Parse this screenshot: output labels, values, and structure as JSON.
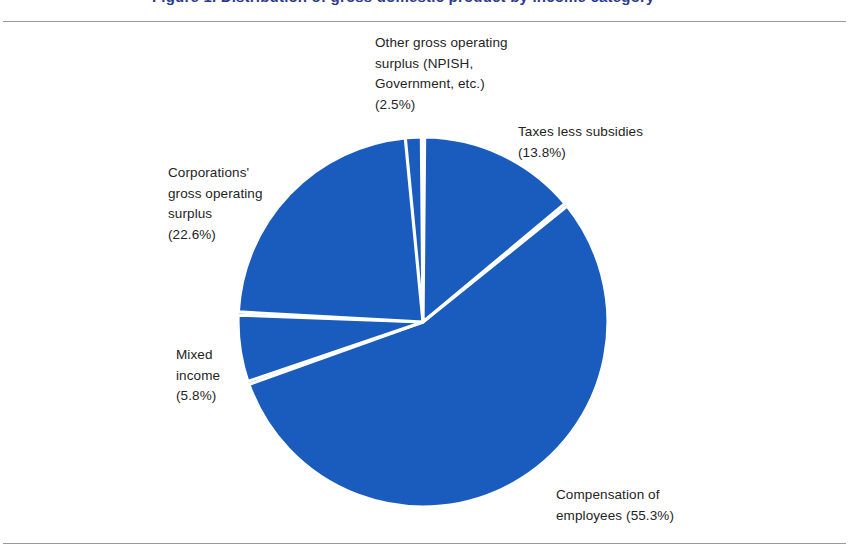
{
  "page": {
    "title_partial": "Figure 1.  Distribution of gross domestic product by income category",
    "background": "#ffffff",
    "rule_color": "#9a9a9a"
  },
  "chart_data": {
    "type": "pie",
    "title": "",
    "xlabel": "",
    "ylabel": "",
    "legend_position": "none",
    "grid": false,
    "slice_color": "#1a5cbd",
    "separator_color": "#ffffff",
    "categories": [
      "Compensation of employees",
      "Taxes less subsidies",
      "Other gross operating surplus (NPISH, Government, etc.)",
      "Corporations' gross operating surplus",
      "Mixed income"
    ],
    "values": [
      55.3,
      13.8,
      2.5,
      22.6,
      5.8
    ],
    "unit": "%",
    "slices": [
      {
        "name": "other-gross-operating-surplus",
        "label": "Other gross operating\nsurplus (NPISH,\nGovernment, etc.)\n(2.5%)",
        "value": 2.5,
        "value_text": "(2.5%)",
        "start_angle": -9.5,
        "end_angle": -0.5
      },
      {
        "name": "taxes-less-subsidies",
        "label": "Taxes less subsidies\n(13.8%)",
        "value": 13.8,
        "value_text": "(13.8%)",
        "start_angle": 0.5,
        "end_angle": 50.18
      },
      {
        "name": "compensation-of-employees",
        "label": "Compensation of\nemployees (55.3%)",
        "value": 55.3,
        "value_text": "(55.3%)",
        "start_angle": 51.18,
        "end_angle": 250.26
      },
      {
        "name": "mixed-income",
        "label": "Mixed\nincome\n(5.8%)",
        "value": 5.8,
        "value_text": "(5.8%)",
        "start_angle": 251.26,
        "end_angle": 272.14
      },
      {
        "name": "corporations-gross-operating-surplus",
        "label": "Corporations'\ngross operating\nsurplus\n(22.6%)",
        "value": 22.6,
        "value_text": "(22.6%)",
        "start_angle": 273.14,
        "end_angle": 354.5
      }
    ],
    "geometry": {
      "center_x": 423,
      "center_y": 322,
      "radius": 185
    }
  }
}
